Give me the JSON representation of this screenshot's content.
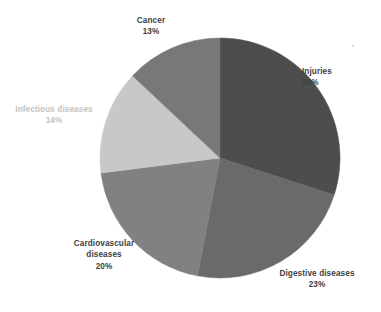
{
  "chart_data": {
    "type": "pie",
    "title": "",
    "subtitle": "",
    "xlabel": "",
    "ylabel": "",
    "legend_position": "none",
    "grid": false,
    "units": "percent",
    "start_angle_deg": 0,
    "direction": "clockwise",
    "categories": [
      "Injuries",
      "Digestive diseases",
      "Cardiovascular diseases",
      "Infectious diseases",
      "Cancer"
    ],
    "values": [
      30,
      23,
      20,
      14,
      13
    ],
    "slices": [
      {
        "id": "injuries",
        "label": "Injuries",
        "value": 30,
        "value_label": "30%",
        "color": "#4d4d4d",
        "label_color": "#404040",
        "label_lines": [
          "Injuries",
          "30%"
        ]
      },
      {
        "id": "digestive-diseases",
        "label": "Digestive diseases",
        "value": 23,
        "value_label": "23%",
        "color": "#6a6a6a",
        "label_color": "#404040",
        "label_lines": [
          "Digestive diseases",
          "23%"
        ]
      },
      {
        "id": "cardiovascular-diseases",
        "label": "Cardiovascular diseases",
        "value": 20,
        "value_label": "20%",
        "color": "#818181",
        "label_color": "#404040",
        "label_lines": [
          "Cardiovascular",
          "diseases",
          "20%"
        ]
      },
      {
        "id": "infectious-diseases",
        "label": "Infectious diseases",
        "value": 14,
        "value_label": "14%",
        "color": "#c8c8c8",
        "label_color": "#c2c2c2",
        "label_lines": [
          "Infectious diseases",
          "14%"
        ]
      },
      {
        "id": "cancer",
        "label": "Cancer",
        "value": 13,
        "value_label": "13%",
        "color": "#787878",
        "label_color": "#404040",
        "label_lines": [
          "Cancer",
          "13%"
        ]
      }
    ]
  },
  "labels": {
    "cancer": {
      "name": "Cancer",
      "value": "13%"
    },
    "injuries": {
      "name": "Injuries",
      "value": "30%"
    },
    "infectious": {
      "name": "Infectious diseases",
      "value": "14%"
    },
    "cardiovascular": {
      "name_line1": "Cardiovascular",
      "name_line2": "diseases",
      "value": "20%"
    },
    "digestive": {
      "name": "Digestive diseases",
      "value": "23%"
    }
  },
  "geometry": {
    "center_x": 220,
    "center_y": 158,
    "radius": 120
  },
  "colors": {
    "background": "#ffffff",
    "label_dark": "#404040",
    "label_light": "#c2c2c2"
  }
}
